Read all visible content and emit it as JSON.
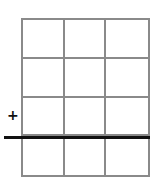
{
  "diagram": {
    "grid": {
      "columns": 3,
      "rows": 4,
      "line_color": "#8a8a8a"
    },
    "bold_line": {
      "color": "#111111",
      "after_row": 3
    },
    "marker": {
      "symbol": "+",
      "color": "#111111"
    }
  }
}
